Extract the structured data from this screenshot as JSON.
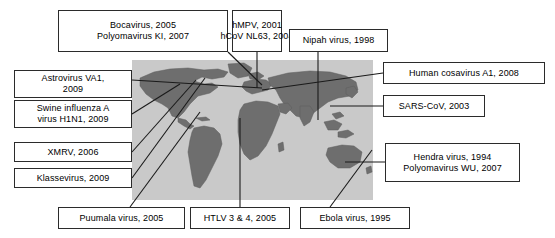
{
  "figure": {
    "type": "annotated-world-map",
    "title": "",
    "map": {
      "ocean_color": "#c9c9c9",
      "land_color": "#6e6e6e",
      "outline_color": "#4a4a4a"
    },
    "line_color": "#1a1a1a",
    "box_border_color": "#2b2b2b",
    "box_fill_color": "#ffffff"
  },
  "labels": {
    "bocavirus": {
      "line1": "Bocavirus, 2005",
      "line2": "Polyomavirus KI, 2007"
    },
    "hmpv": {
      "line1": "hMPV, 2001",
      "line2": "hCoV NL63, 2004"
    },
    "nipah": {
      "line1": "Nipah virus, 1998",
      "line2": ""
    },
    "astrovirus": {
      "line1": "Astrovirus VA1,",
      "line2": "2009"
    },
    "swine": {
      "line1": "Swine influenza A",
      "line2": "virus H1N1, 2009"
    },
    "xmrv": {
      "line1": "XMRV, 2006",
      "line2": ""
    },
    "klassevirus": {
      "line1": "Klassevirus, 2009",
      "line2": ""
    },
    "cosavirus": {
      "line1": "Human cosavirus A1, 2008",
      "line2": ""
    },
    "sars": {
      "line1": "SARS-CoV, 2003",
      "line2": ""
    },
    "hendra": {
      "line1": "Hendra virus, 1994",
      "line2": "Polyomavirus WU, 2007"
    },
    "puumala": {
      "line1": "Puumala virus, 2005",
      "line2": ""
    },
    "htlv": {
      "line1": "HTLV 3 & 4, 2005",
      "line2": ""
    },
    "ebola": {
      "line1": "Ebola virus, 1995",
      "line2": ""
    }
  }
}
